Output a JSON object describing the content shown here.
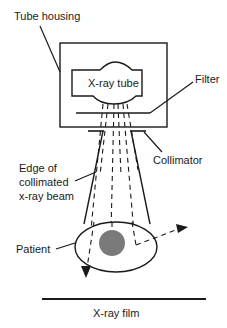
{
  "diagram": {
    "labels": {
      "tube_housing": "Tube housing",
      "xray_tube": "X-ray tube",
      "filter": "Filter",
      "collimator": "Collimator",
      "beam_edge": "Edge of\ncollimated\nx-ray beam",
      "patient": "Patient",
      "film": "X-ray film"
    },
    "colors": {
      "line": "#1a1a1a",
      "target": "#7a7a7a",
      "background": "#ffffff"
    }
  }
}
